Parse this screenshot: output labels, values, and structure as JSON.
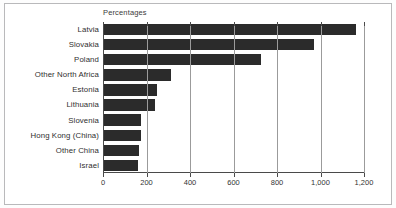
{
  "chart_data": {
    "type": "bar",
    "orientation": "horizontal",
    "title": "Percentages",
    "xlabel": "",
    "ylabel": "",
    "xlim": [
      0,
      1200
    ],
    "grid": true,
    "legend": "none",
    "xticks": [
      0,
      200,
      400,
      600,
      800,
      1000,
      1200
    ],
    "xtick_labels": [
      "0",
      "200",
      "400",
      "600",
      "800",
      "1,000",
      "1,200"
    ],
    "categories": [
      "Latvia",
      "Slovakia",
      "Poland",
      "Other North Africa",
      "Estonia",
      "Lithuania",
      "Slovenia",
      "Hong Kong (China)",
      "Other China",
      "Israel"
    ],
    "values": [
      1160,
      965,
      720,
      310,
      245,
      235,
      168,
      172,
      159,
      155
    ],
    "bar_color": "#2b2b2b",
    "grid_color": "#9b9b9b",
    "axis_color": "#4a4a4a"
  }
}
